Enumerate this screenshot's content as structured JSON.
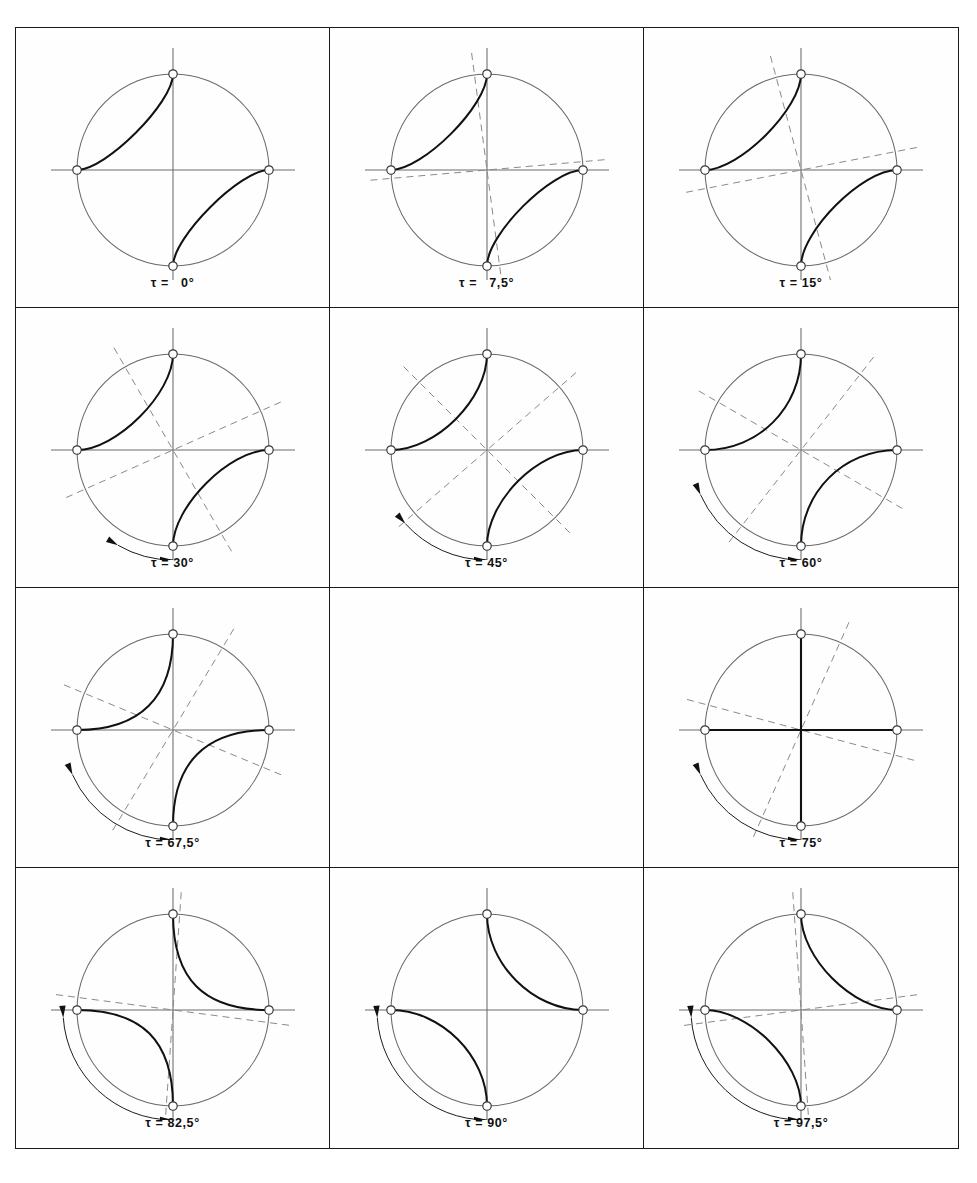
{
  "figure": {
    "type": "stereographic-projection-series",
    "symbol": "τ",
    "equals": "=",
    "degree": "°",
    "columns": 3,
    "rows": 4,
    "panel_count": 11,
    "colors": {
      "frame": "#1a1a1a",
      "circle": "#6a6a6a",
      "axis": "#6a6a6a",
      "dashed": "#8a8a8a",
      "curve": "#111111",
      "marker_fill": "#ffffff",
      "marker_stroke": "#333333",
      "background": "#fefefe",
      "label": "#111111"
    },
    "geometry": {
      "view": 300,
      "cx": 150,
      "cy": 140,
      "radius": 96,
      "axis_overhang": 26,
      "dash_overhang": 22,
      "marker_radius": 4.2,
      "arc_radius_offset": 14
    }
  },
  "panels": [
    {
      "id": "panel-tau-0",
      "tau": 0,
      "label": "τ =   0°",
      "dashed_visible": false,
      "dash_angles": [],
      "curve_mode": "nw-se",
      "curve_tightness": 0.3,
      "degenerate": false,
      "arc_indicator": "none",
      "double_arrow": false
    },
    {
      "id": "panel-tau-7-5",
      "tau": 7.5,
      "label": "τ =   7,5°",
      "dashed_visible": true,
      "dash_angles": [
        7.5,
        5.0
      ],
      "curve_mode": "nw-se",
      "curve_tightness": 0.33,
      "degenerate": false,
      "arc_indicator": "none",
      "double_arrow": true
    },
    {
      "id": "panel-tau-15",
      "tau": 15,
      "label": "τ = 15°",
      "dashed_visible": true,
      "dash_angles": [
        15.0,
        11.0
      ],
      "curve_mode": "nw-se",
      "curve_tightness": 0.36,
      "degenerate": false,
      "arc_indicator": "none",
      "double_arrow": true
    },
    {
      "id": "panel-tau-30",
      "tau": 30,
      "label": "τ = 30°",
      "dashed_visible": true,
      "dash_angles": [
        30.0,
        24.0
      ],
      "curve_mode": "nw-se",
      "curve_tightness": 0.41,
      "degenerate": false,
      "arc_indicator": "short",
      "double_arrow": false
    },
    {
      "id": "panel-tau-45",
      "tau": 45,
      "label": "τ = 45°",
      "dashed_visible": true,
      "dash_angles": [
        45.0,
        41.0
      ],
      "curve_mode": "nw-se",
      "curve_tightness": 0.47,
      "degenerate": false,
      "arc_indicator": "medium",
      "double_arrow": false
    },
    {
      "id": "panel-tau-60",
      "tau": 60,
      "label": "τ = 60°",
      "dashed_visible": true,
      "dash_angles": [
        60.0,
        52.0
      ],
      "curve_mode": "nw-se",
      "curve_tightness": 0.56,
      "degenerate": false,
      "arc_indicator": "long",
      "double_arrow": false
    },
    {
      "id": "panel-tau-67-5",
      "tau": 67.5,
      "label": "τ = 67,5°",
      "dashed_visible": true,
      "dash_angles": [
        67.5,
        59.0
      ],
      "curve_mode": "nw-se",
      "curve_tightness": 0.66,
      "degenerate": false,
      "arc_indicator": "long",
      "double_arrow": false
    },
    {
      "id": "panel-empty",
      "tau": null,
      "label": "",
      "empty": true
    },
    {
      "id": "panel-tau-75",
      "tau": 75,
      "label": "τ = 75°",
      "dashed_visible": true,
      "dash_angles": [
        75.0,
        66.0
      ],
      "curve_mode": "radial",
      "curve_tightness": 1.0,
      "degenerate": true,
      "arc_indicator": "long",
      "double_arrow": false
    },
    {
      "id": "panel-tau-82-5",
      "tau": 82.5,
      "label": "τ = 82,5°",
      "dashed_visible": true,
      "dash_angles": [
        82.5,
        86.0
      ],
      "curve_mode": "ne-sw",
      "curve_tightness": 0.68,
      "degenerate": false,
      "arc_indicator": "xlong",
      "double_arrow": false
    },
    {
      "id": "panel-tau-90",
      "tau": 90,
      "label": "τ = 90°",
      "dashed_visible": false,
      "dash_angles": [],
      "curve_mode": "ne-sw",
      "curve_tightness": 0.52,
      "degenerate": false,
      "arc_indicator": "xlong",
      "double_arrow": false
    },
    {
      "id": "panel-tau-97-5",
      "tau": 97.5,
      "label": "τ = 97,5°",
      "dashed_visible": true,
      "dash_angles": [
        97.5,
        94.0
      ],
      "curve_mode": "ne-sw",
      "curve_tightness": 0.46,
      "degenerate": false,
      "arc_indicator": "xlong",
      "double_arrow": false
    }
  ],
  "chart_data": {
    "type": "line",
    "title": "",
    "xlabel": "",
    "ylabel": "",
    "series_parameter": "τ",
    "series_unit": "degree",
    "tau_values": [
      0,
      7.5,
      15,
      30,
      45,
      60,
      67.5,
      75,
      82.5,
      90,
      97.5
    ],
    "critical_tau": 75,
    "note": "At tau = 75 degrees the curves degenerate to straight radii; beyond it the curve pair switches from the NW-SE quadrant pair to the NE-SW quadrant pair.",
    "markers_per_panel": 4,
    "marker_positions_deg": [
      90,
      180,
      270,
      0
    ],
    "grid": false,
    "legend": "none"
  }
}
